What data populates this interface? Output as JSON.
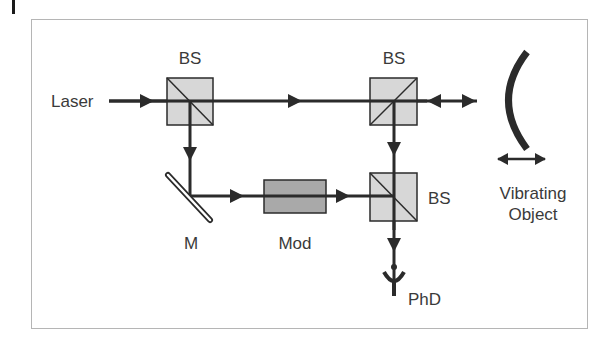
{
  "diagram": {
    "title": "",
    "type": "optical-setup",
    "labels": {
      "laser": "Laser",
      "bs1": "BS",
      "bs2": "BS",
      "bs3": "BS",
      "mirror": "M",
      "modulator": "Mod",
      "object_line1": "Vibrating",
      "object_line2": "Object",
      "detector": "PhD"
    },
    "components": [
      {
        "id": "laser",
        "kind": "source",
        "label": "Laser"
      },
      {
        "id": "bs1",
        "kind": "beam-splitter",
        "label": "BS"
      },
      {
        "id": "bs2",
        "kind": "beam-splitter",
        "label": "BS"
      },
      {
        "id": "mirror",
        "kind": "mirror",
        "label": "M"
      },
      {
        "id": "mod",
        "kind": "modulator",
        "label": "Mod"
      },
      {
        "id": "bs3",
        "kind": "beam-splitter",
        "label": "BS"
      },
      {
        "id": "object",
        "kind": "vibrating-object",
        "label": "Vibrating Object"
      },
      {
        "id": "phd",
        "kind": "photodetector",
        "label": "PhD"
      }
    ],
    "edges": [
      {
        "from": "laser",
        "to": "bs1"
      },
      {
        "from": "bs1",
        "to": "bs2"
      },
      {
        "from": "bs2",
        "to": "object",
        "bidirectional": true
      },
      {
        "from": "bs1",
        "to": "mirror"
      },
      {
        "from": "mirror",
        "to": "mod"
      },
      {
        "from": "mod",
        "to": "bs3"
      },
      {
        "from": "bs2",
        "to": "bs3"
      },
      {
        "from": "bs3",
        "to": "phd"
      }
    ],
    "colors": {
      "line": "#2b2b2b",
      "bs_fill": "#d0d0d0",
      "mod_fill": "#a9a9a9",
      "frame": "#b5b5b5",
      "text": "#3a3a3a"
    }
  }
}
